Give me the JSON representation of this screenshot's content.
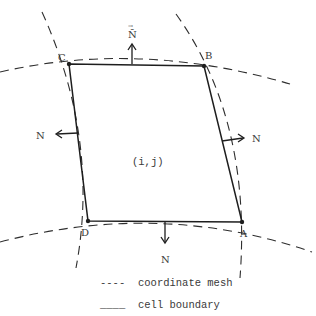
{
  "diagram": {
    "vertices": {
      "A": {
        "label": "A",
        "x": 242,
        "y": 222
      },
      "B": {
        "label": "B",
        "x": 204,
        "y": 66
      },
      "C": {
        "label": "C",
        "x": 69,
        "y": 64
      },
      "D": {
        "label": "D",
        "x": 88,
        "y": 221
      }
    },
    "cell_label": "(i,j)",
    "normals": {
      "top": {
        "label": "N̄",
        "vector_marker": "→"
      },
      "left": {
        "label": "N"
      },
      "right": {
        "label": "N"
      },
      "bottom": {
        "label": "N"
      }
    },
    "legend": {
      "mesh": {
        "symbol": "----",
        "text": "coordinate mesh"
      },
      "cell": {
        "symbol": "____",
        "text": "cell boundary"
      }
    },
    "colors": {
      "line": "#1e1e1e",
      "text": "#3a3a3a",
      "background": "#ffffff"
    }
  }
}
